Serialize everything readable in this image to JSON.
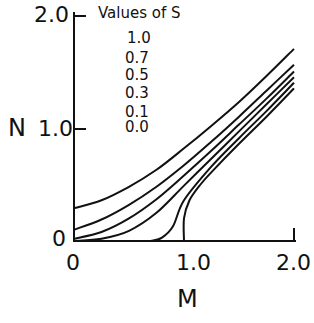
{
  "chart_data": {
    "type": "line",
    "title": "",
    "xlabel": "M",
    "ylabel": "N",
    "xlim": [
      0,
      2.0
    ],
    "ylim": [
      0,
      2.0
    ],
    "x_ticks": [
      "0",
      "1.0",
      "2.0"
    ],
    "y_ticks": [
      "0",
      "1.0",
      "2.0"
    ],
    "grid": false,
    "legend": {
      "title": "Values of S",
      "entries": [
        "1.0",
        "0.7",
        "0.5",
        "0.3",
        "0.1",
        "0.0"
      ],
      "position": "top-left inside"
    },
    "series": [
      {
        "name": "S=1.0",
        "x": [
          0,
          0.25,
          0.5,
          0.75,
          1.0,
          1.25,
          1.5,
          1.75,
          2.0
        ],
        "y": [
          0.29,
          0.36,
          0.48,
          0.63,
          0.82,
          1.02,
          1.23,
          1.46,
          1.7
        ]
      },
      {
        "name": "S=0.7",
        "x": [
          0,
          0.25,
          0.5,
          0.75,
          1.0,
          1.25,
          1.5,
          1.75,
          2.0
        ],
        "y": [
          0.1,
          0.19,
          0.32,
          0.48,
          0.67,
          0.88,
          1.1,
          1.33,
          1.56
        ]
      },
      {
        "name": "S=0.5",
        "x": [
          0,
          0.25,
          0.5,
          0.75,
          1.0,
          1.25,
          1.5,
          1.75,
          2.0
        ],
        "y": [
          0.02,
          0.08,
          0.2,
          0.37,
          0.58,
          0.8,
          1.03,
          1.26,
          1.5
        ]
      },
      {
        "name": "S=0.3",
        "x": [
          0,
          0.25,
          0.5,
          0.75,
          1.0,
          1.25,
          1.5,
          1.75,
          2.0
        ],
        "y": [
          0.0,
          0.02,
          0.09,
          0.25,
          0.49,
          0.73,
          0.97,
          1.21,
          1.45
        ]
      },
      {
        "name": "S=0.1",
        "x": [
          0.7,
          0.8,
          0.9,
          1.0,
          1.25,
          1.5,
          1.75,
          2.0
        ],
        "y": [
          0.0,
          0.03,
          0.13,
          0.36,
          0.66,
          0.91,
          1.15,
          1.4
        ]
      },
      {
        "name": "S=0.0",
        "x": [
          1.0,
          1.0,
          1.05,
          1.15,
          1.25,
          1.5,
          1.75,
          2.0
        ],
        "y": [
          0.0,
          0.2,
          0.36,
          0.5,
          0.61,
          0.86,
          1.1,
          1.35
        ]
      }
    ]
  }
}
